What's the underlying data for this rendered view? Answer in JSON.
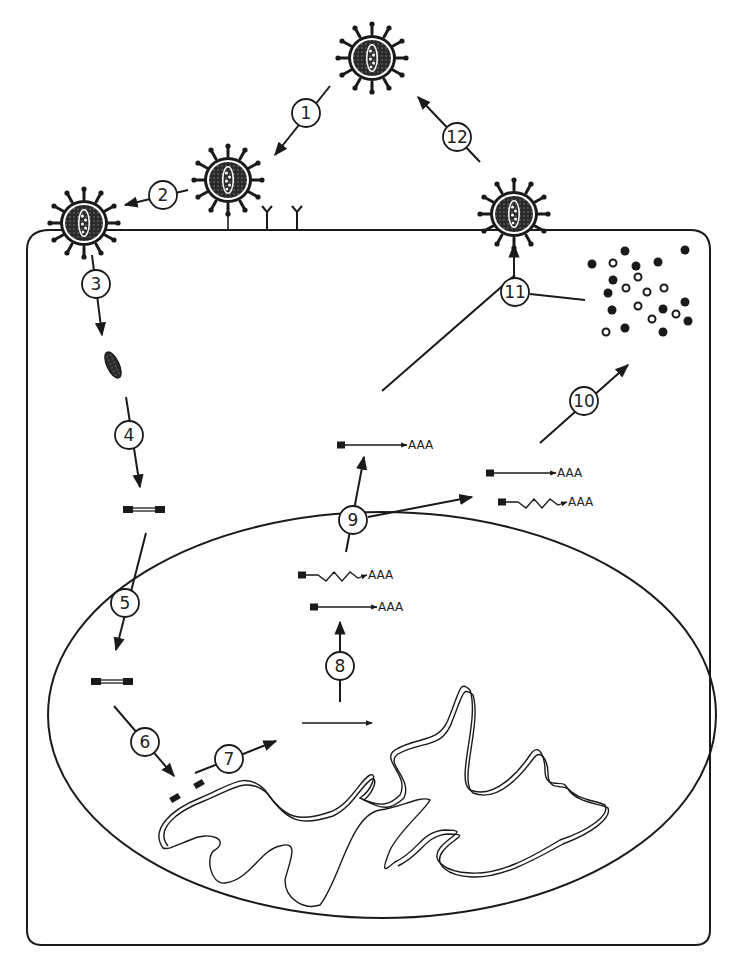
{
  "diagram": {
    "title": "",
    "type": "viral life cycle",
    "steps": [
      {
        "id": "1",
        "label": "1"
      },
      {
        "id": "2",
        "label": "2"
      },
      {
        "id": "3",
        "label": "3"
      },
      {
        "id": "4",
        "label": "4"
      },
      {
        "id": "5",
        "label": "5"
      },
      {
        "id": "6",
        "label": "6"
      },
      {
        "id": "7",
        "label": "7"
      },
      {
        "id": "8",
        "label": "8"
      },
      {
        "id": "9",
        "label": "9"
      },
      {
        "id": "10",
        "label": "10"
      },
      {
        "id": "11",
        "label": "11"
      },
      {
        "id": "12",
        "label": "12"
      }
    ],
    "transcripts": [
      {
        "id": "nuc-spliced",
        "tail": "AAA"
      },
      {
        "id": "nuc-straight",
        "tail": "AAA"
      },
      {
        "id": "cyto-straight-upper",
        "tail": "AAA"
      },
      {
        "id": "cyto-straight-right",
        "tail": "AAA"
      },
      {
        "id": "cyto-spliced-right",
        "tail": "AAA"
      }
    ],
    "colors": {
      "line": "#1a1a1a",
      "virus_fill": "#3a3a3a",
      "background": "#ffffff"
    }
  }
}
